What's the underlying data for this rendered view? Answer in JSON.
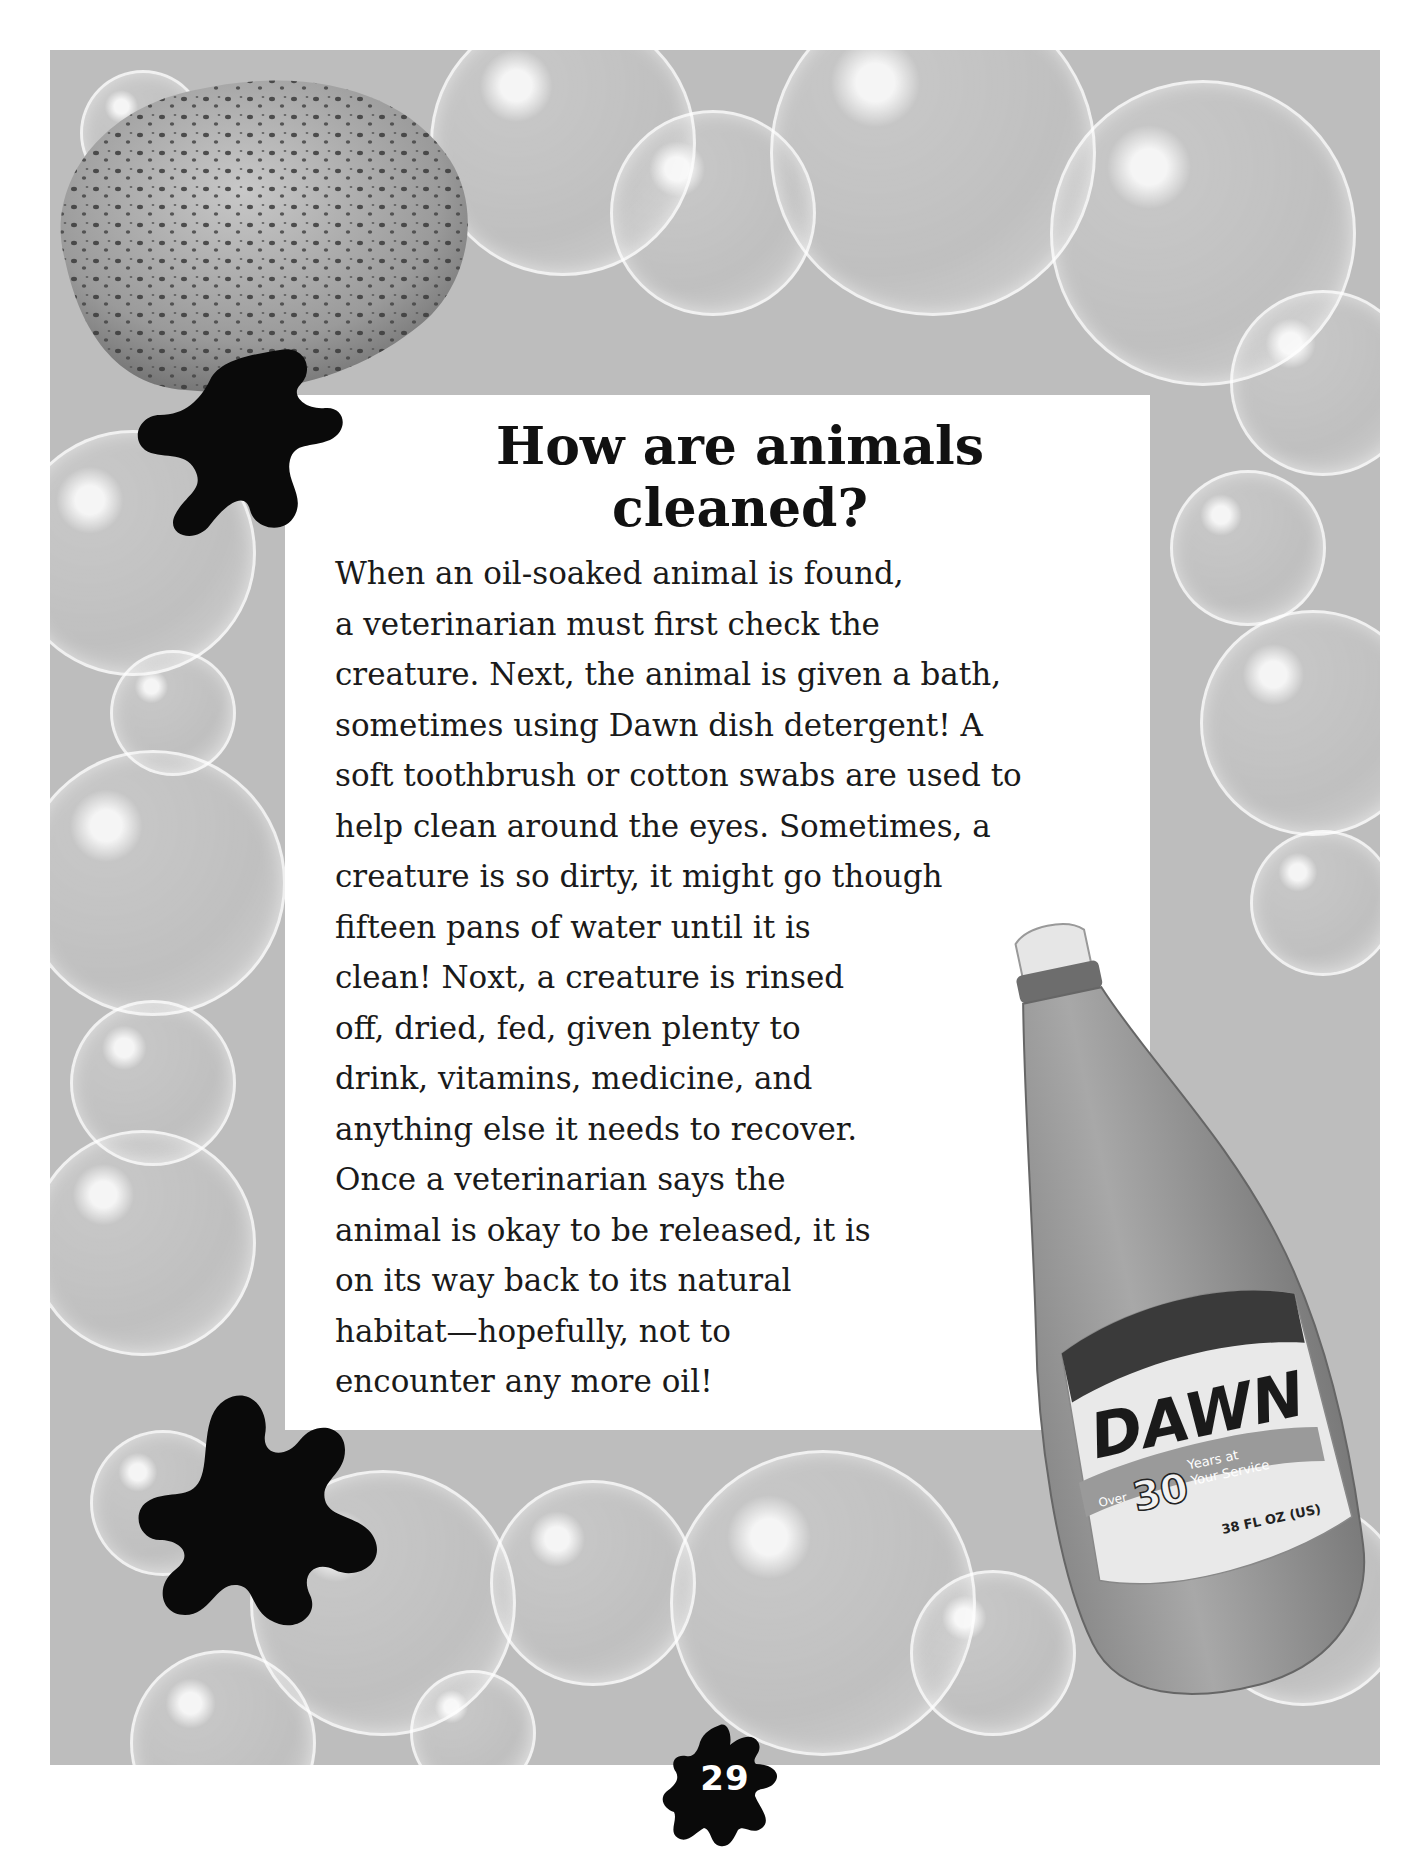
{
  "page": {
    "title": "How are animals cleaned?",
    "title_lines": [
      "How are animals",
      "cleaned?"
    ],
    "body_lines": [
      "When an oil-soaked animal is found,",
      "a veterinarian must first check the",
      "creature.  Next, the animal is given a bath,",
      "sometimes using Dawn dish detergent! A",
      "soft toothbrush or cotton swabs are used to",
      "help clean around the eyes.  Sometimes, a",
      "creature is so dirty, it might go though",
      "fifteen pans of water until it is",
      "clean!  Noxt, a creature is rinsed",
      "off, dried, fed, given plenty to",
      "drink, vitamins, medicine, and",
      "anything else it needs to recover.",
      "Once a veterinarian says the",
      "animal is okay to be released, it is",
      "on its way back to its natural",
      "habitat—hopefully, not to",
      "encounter any more oil!"
    ],
    "page_number": "29"
  },
  "images": {
    "sponge": "sponge-image",
    "background": "soap-bubbles-background",
    "bottle": {
      "brand": "DAWN",
      "ribbon_over": "Over",
      "ribbon_number": "30",
      "ribbon_text_1": "Years at",
      "ribbon_text_2": "Your Service",
      "volume": "38 FL OZ (US)"
    }
  },
  "colors": {
    "background_gray": "#bdbdbd",
    "panel": "#ffffff",
    "ink": "#111111",
    "blot": "#0a0a0a"
  }
}
